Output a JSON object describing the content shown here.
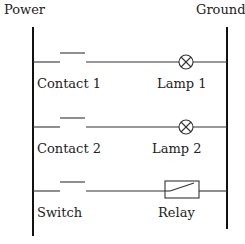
{
  "diagram": {
    "type": "ladder-logic",
    "rails": {
      "left": "Power",
      "right": "Ground"
    },
    "rungs": [
      {
        "input": {
          "type": "normally-open-contact",
          "label": "Contact 1"
        },
        "output": {
          "type": "lamp",
          "label": "Lamp 1"
        }
      },
      {
        "input": {
          "type": "normally-open-contact",
          "label": "Contact 2"
        },
        "output": {
          "type": "lamp",
          "label": "Lamp 2"
        }
      },
      {
        "input": {
          "type": "switch",
          "label": "Switch"
        },
        "output": {
          "type": "relay-coil",
          "label": "Relay"
        }
      }
    ]
  }
}
